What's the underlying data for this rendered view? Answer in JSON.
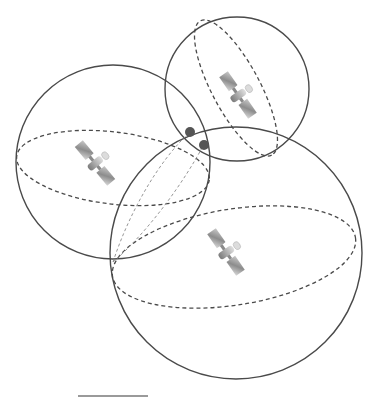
{
  "diagram": {
    "spheres": [
      {
        "id": "left",
        "cx": 113,
        "cy": 162,
        "r": 97,
        "equator": {
          "cx": 113,
          "cy": 168,
          "rx": 97,
          "ry": 36,
          "rotate": 7
        },
        "satellite": {
          "x": 95,
          "y": 163,
          "angle": 40
        }
      },
      {
        "id": "top-right",
        "cx": 237,
        "cy": 89,
        "r": 72,
        "equator": {
          "cx": 236,
          "cy": 88,
          "rx": 76,
          "ry": 24,
          "rotate": 60
        },
        "satellite": {
          "x": 238,
          "y": 95,
          "angle": 40
        }
      },
      {
        "id": "bottom-large",
        "cx": 236,
        "cy": 253,
        "r": 126,
        "equator": {
          "cx": 234,
          "cy": 257,
          "rx": 123,
          "ry": 48,
          "rotate": -9
        },
        "satellite": {
          "x": 226,
          "y": 252,
          "angle": 40
        }
      }
    ],
    "intersection_points": [
      {
        "x": 190,
        "y": 132,
        "r": 5
      },
      {
        "x": 204,
        "y": 145,
        "r": 5
      }
    ],
    "colors": {
      "stroke": "#4a4a4a",
      "dot": "#555555",
      "satellite_panel": "#9c9c9c",
      "satellite_body": "#b5b5b5"
    }
  }
}
